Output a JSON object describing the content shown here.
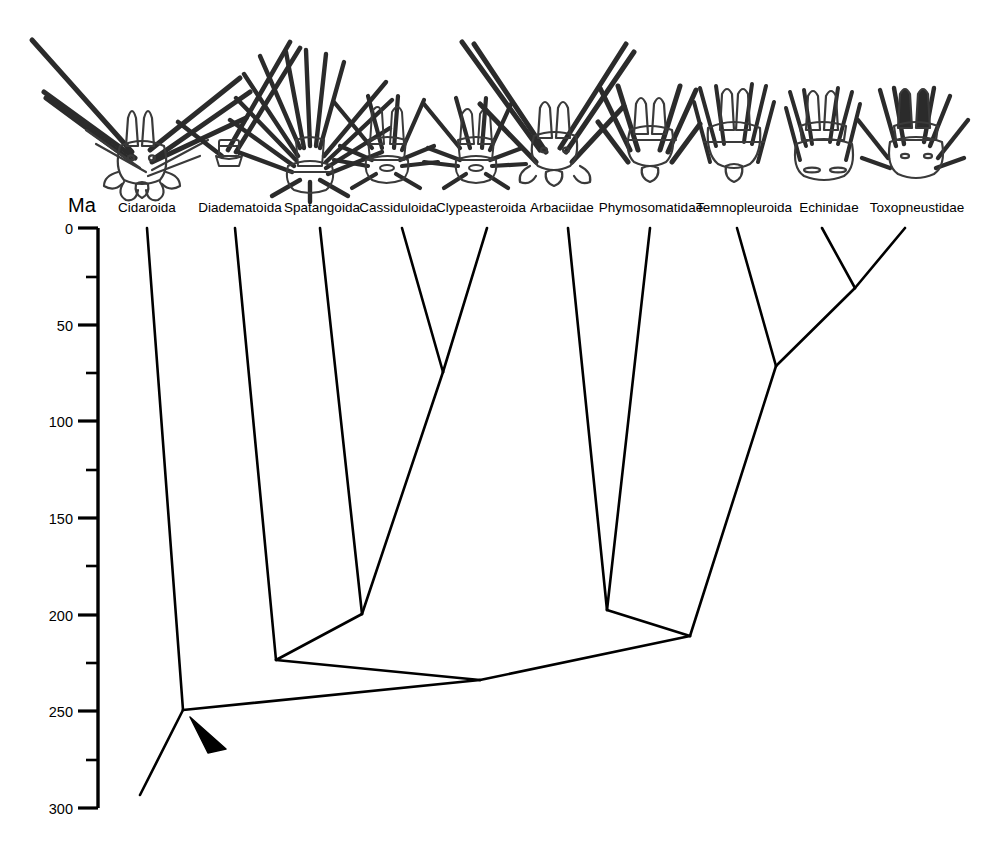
{
  "figure": {
    "type": "phylogenetic-tree",
    "axis": {
      "unit_label": "Ma",
      "orientation": "vertical",
      "direction": "top-is-present",
      "min": 0,
      "max": 300,
      "major_tick_interval": 50,
      "minor_tick_interval": 25,
      "major_ticks": [
        {
          "value": 0,
          "label": "0"
        },
        {
          "value": 50,
          "label": "50"
        },
        {
          "value": 100,
          "label": "100"
        },
        {
          "value": 150,
          "label": "150"
        },
        {
          "value": 200,
          "label": "200"
        },
        {
          "value": 250,
          "label": "250"
        },
        {
          "value": 300,
          "label": "300"
        }
      ],
      "minor_ticks": [
        25,
        75,
        125,
        175,
        225,
        275
      ]
    },
    "taxa": [
      {
        "id": "cidaroida",
        "label": "Cidaroida",
        "x": 147,
        "label_x": 147
      },
      {
        "id": "diadematoida",
        "label": "Diadematoida",
        "x": 235,
        "label_x": 240
      },
      {
        "id": "spatangoida",
        "label": "Spatangoida",
        "x": 320,
        "label_x": 322
      },
      {
        "id": "cassiduloida",
        "label": "Cassiduloida",
        "x": 402,
        "label_x": 398
      },
      {
        "id": "clypeasteroida",
        "label": "Clypeasteroida",
        "x": 487,
        "label_x": 481
      },
      {
        "id": "arbaciidae",
        "label": "Arbaciidae",
        "x": 568,
        "label_x": 562
      },
      {
        "id": "phymosomatidae",
        "label": "Phymosomatidae",
        "x": 650,
        "label_x": 651
      },
      {
        "id": "temnopleuroida",
        "label": "Temnopleuroida",
        "x": 737,
        "label_x": 744
      },
      {
        "id": "echinidae",
        "label": "Echinidae",
        "x": 822,
        "label_x": 829
      },
      {
        "id": "toxopneustidae",
        "label": "Toxopneustidae",
        "x": 905,
        "label_x": 917
      }
    ],
    "nodes": [
      {
        "id": "root",
        "x": 183,
        "age": 250,
        "label": "root"
      },
      {
        "id": "node-diadematoida-split",
        "x": 276,
        "age": 223,
        "label": "diadematoid divergence"
      },
      {
        "id": "node-irregular-stem",
        "x": 480,
        "age": 235,
        "label": "irregular echinoid stem"
      },
      {
        "id": "node-spatangoida-split",
        "x": 362,
        "age": 200,
        "label": "spatangoid divergence"
      },
      {
        "id": "node-cassidulo-clypeaster",
        "x": 443,
        "age": 75,
        "label": "cassiduloid clypeasteroid divergence"
      },
      {
        "id": "node-arbacia-phymosoma",
        "x": 607,
        "age": 200,
        "label": "arbaciid phymosomatid divergence"
      },
      {
        "id": "node-echinacea",
        "x": 690,
        "age": 212,
        "label": "echinacean divergence"
      },
      {
        "id": "node-temnopleurid-split",
        "x": 776,
        "age": 72,
        "label": "temnopleuroid divergence"
      },
      {
        "id": "node-echinid-toxopneustid",
        "x": 855,
        "age": 32,
        "label": "echinid toxopneustid divergence"
      }
    ],
    "root_stem": {
      "x_end": 140,
      "age_end": 293
    },
    "arrowhead": {
      "label": "calibration-arrowhead",
      "x": 196,
      "y": 722
    },
    "illustrations": [
      {
        "id": "illus-cidaroida",
        "label": "cidaroid test with long spines"
      },
      {
        "id": "illus-diadematoida",
        "label": "diadematoid test with slender spines"
      },
      {
        "id": "illus-spatangoida",
        "label": "spatangoid test with dense spines"
      },
      {
        "id": "illus-cassiduloida",
        "label": "cassiduloid test"
      },
      {
        "id": "illus-clypeasteroida",
        "label": "clypeasteroid test"
      },
      {
        "id": "illus-arbaciidae",
        "label": "arbaciid test with long spines"
      },
      {
        "id": "illus-phymosomatidae",
        "label": "phymosomatid test"
      },
      {
        "id": "illus-temnopleuroida",
        "label": "temnopleuroid test"
      },
      {
        "id": "illus-echinidae",
        "label": "echinid test"
      },
      {
        "id": "illus-toxopneustidae",
        "label": "toxopneustid test"
      }
    ],
    "colors": {
      "line": "#000000",
      "background": "#ffffff"
    }
  }
}
